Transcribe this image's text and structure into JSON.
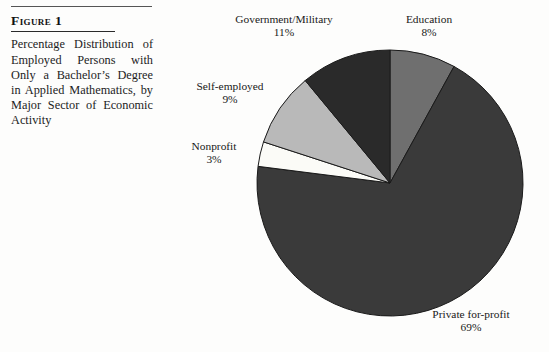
{
  "figure": {
    "label": "Figure 1",
    "caption": "Percentage Distribution of Employed Persons with Only a Bachelor’s Degree in Applied Mathematics, by Major Sector of Economic Activity"
  },
  "labels": {
    "government": {
      "name": "Government/Military",
      "pct": "11%"
    },
    "education": {
      "name": "Education",
      "pct": "8%"
    },
    "self_employed": {
      "name": "Self-employed",
      "pct": "9%"
    },
    "nonprofit": {
      "name": "Nonprofit",
      "pct": "3%"
    },
    "private": {
      "name": "Private for-profit",
      "pct": "69%"
    }
  },
  "chart_data": {
    "type": "pie",
    "title": "Percentage Distribution of Employed Persons with Only a Bachelor’s Degree in Applied Mathematics, by Major Sector of Economic Activity",
    "categories": [
      "Education",
      "Private for-profit",
      "Nonprofit",
      "Self-employed",
      "Government/Military"
    ],
    "values": [
      8,
      69,
      3,
      9,
      11
    ],
    "value_labels": [
      "8%",
      "69%",
      "3%",
      "9%",
      "11%"
    ],
    "units": "percent",
    "start_angle_deg": 0,
    "direction": "clockwise",
    "legend": "none",
    "labels_position": "outside",
    "colors": [
      "#6f6f6f",
      "#3a3a3a",
      "#fbfbf7",
      "#b9b9b9",
      "#2a2a2a"
    ],
    "stroke_color": "#1a1a1a",
    "center": {
      "x": 230,
      "y": 183
    },
    "radius": 133
  }
}
